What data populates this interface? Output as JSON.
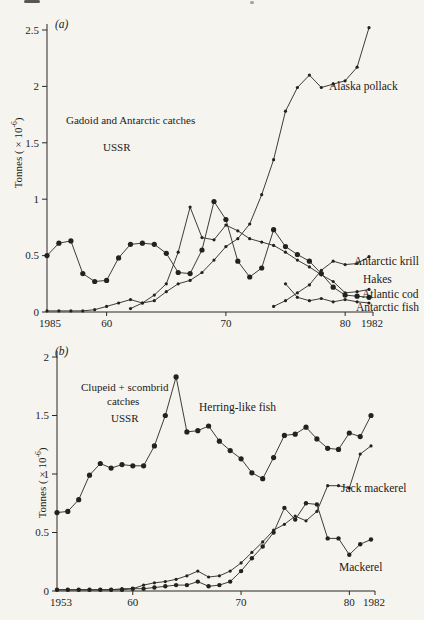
{
  "chart_data": [
    {
      "id": "a",
      "type": "line",
      "panel_label": "(a)",
      "annotations": [
        "Gadoid and Antarctic catches",
        "USSR"
      ],
      "ylabel": "Tonnes ( × 10⁻⁶)",
      "ylabel_parts": {
        "prefix": "Tonnes ( × 10",
        "exp": "-6",
        "suffix": ")"
      },
      "ylim": [
        0,
        2.5
      ],
      "yticks": [
        0,
        0.5,
        1,
        1.5,
        2,
        2.5
      ],
      "ytick_labels": [
        "0",
        "0.5",
        "1",
        "1.5",
        "2",
        "2.5"
      ],
      "x_range": [
        1955,
        1982
      ],
      "xticks": [
        1960,
        1970,
        1980
      ],
      "xtick_labels": [
        "60",
        "70",
        "80"
      ],
      "x_first_label": "1985",
      "x_last_label": "1982",
      "legend_position": "inline-right",
      "grid": false,
      "series": [
        {
          "name": "Alaska pollack",
          "start_year": 1955,
          "marker": "small",
          "values": [
            0.01,
            0.01,
            0.01,
            0.01,
            0.02,
            0.05,
            0.08,
            0.11,
            0.08,
            0.1,
            0.18,
            0.25,
            0.28,
            0.35,
            0.46,
            0.58,
            0.65,
            0.78,
            1.04,
            1.35,
            1.78,
            1.99,
            2.1,
            1.99,
            2.02,
            2.05,
            2.17,
            2.52
          ]
        },
        {
          "name": "Atlantic cod",
          "start_year": 1955,
          "marker": "large",
          "values": [
            0.5,
            0.61,
            0.63,
            0.34,
            0.27,
            0.28,
            0.48,
            0.6,
            0.61,
            0.6,
            0.52,
            0.35,
            0.34,
            0.55,
            0.98,
            0.82,
            0.45,
            0.31,
            0.39,
            0.73,
            0.58,
            0.51,
            0.45,
            0.34,
            0.22,
            0.15,
            0.14,
            0.13
          ]
        },
        {
          "name": "Hakes",
          "start_year": 1962,
          "marker": "small",
          "values": [
            0.03,
            0.08,
            0.15,
            0.25,
            0.53,
            0.93,
            0.66,
            0.64,
            0.77,
            0.72,
            0.65,
            0.62,
            0.59,
            0.53,
            0.46,
            0.4,
            0.33,
            0.27,
            0.17,
            0.18,
            0.2
          ]
        },
        {
          "name": "Antarctic krill",
          "start_year": 1974,
          "marker": "small",
          "values": [
            0.05,
            0.1,
            0.17,
            0.24,
            0.37,
            0.45,
            0.42,
            0.43,
            0.49
          ]
        },
        {
          "name": "Antarctic fish",
          "start_year": 1975,
          "marker": "small",
          "values": [
            0.25,
            0.13,
            0.1,
            0.12,
            0.09,
            0.11,
            0.09,
            0.08
          ]
        }
      ]
    },
    {
      "id": "b",
      "type": "line",
      "panel_label": "(b)",
      "annotations": [
        "Clupeid + scombrid",
        "catches",
        "USSR"
      ],
      "ylabel": "Tonnes ( × 10⁻⁶)",
      "ylabel_parts": {
        "prefix": "Tonnes ( × 10",
        "exp": "-6",
        "suffix": ")"
      },
      "ylim": [
        0,
        2
      ],
      "yticks": [
        0,
        0.5,
        1,
        1.5,
        2
      ],
      "ytick_labels": [
        "0",
        "0.5",
        "1",
        "1.5",
        "2"
      ],
      "x_range": [
        1953,
        1982
      ],
      "xticks": [
        1960,
        1970,
        1980
      ],
      "xtick_labels": [
        "60",
        "70",
        "80"
      ],
      "x_first_label": "1953",
      "x_last_label": "1982",
      "legend_position": "inline-right",
      "grid": false,
      "series": [
        {
          "name": "Herring-like fish",
          "start_year": 1953,
          "marker": "large",
          "values": [
            0.67,
            0.68,
            0.78,
            0.99,
            1.09,
            1.05,
            1.08,
            1.07,
            1.07,
            1.24,
            1.5,
            1.83,
            1.36,
            1.37,
            1.41,
            1.28,
            1.2,
            1.13,
            1.01,
            0.96,
            1.14,
            1.33,
            1.34,
            1.4,
            1.3,
            1.22,
            1.21,
            1.35,
            1.32,
            1.5
          ]
        },
        {
          "name": "Jack mackerel",
          "start_year": 1953,
          "marker": "small",
          "values": [
            0.01,
            0.01,
            0.01,
            0.01,
            0.01,
            0.01,
            0.02,
            0.02,
            0.05,
            0.07,
            0.08,
            0.1,
            0.13,
            0.17,
            0.12,
            0.13,
            0.17,
            0.24,
            0.33,
            0.42,
            0.52,
            0.57,
            0.64,
            0.6,
            0.68,
            0.9,
            0.9,
            0.88,
            1.17,
            1.24
          ]
        },
        {
          "name": "Mackerel",
          "start_year": 1953,
          "marker": "medium",
          "values": [
            0.01,
            0.01,
            0.01,
            0.01,
            0.01,
            0.01,
            0.01,
            0.02,
            0.02,
            0.03,
            0.04,
            0.05,
            0.05,
            0.08,
            0.04,
            0.05,
            0.08,
            0.17,
            0.28,
            0.38,
            0.5,
            0.71,
            0.61,
            0.75,
            0.74,
            0.45,
            0.45,
            0.31,
            0.4,
            0.44
          ]
        }
      ]
    }
  ]
}
